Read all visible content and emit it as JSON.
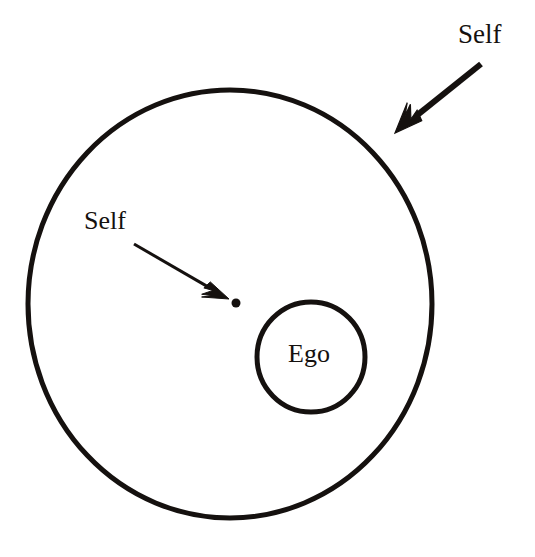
{
  "diagram": {
    "background_color": "#ffffff",
    "ink_color": "#15110f",
    "labels": {
      "self_outer": "Self",
      "self_inner": "Self",
      "ego": "Ego"
    },
    "shapes": {
      "outer_circle": {
        "name": "self-boundary-circle",
        "center_x": 230,
        "center_y": 304,
        "radius_x": 202,
        "radius_y": 214,
        "stroke_width": 5,
        "fill": "none",
        "stroke": "#15110f"
      },
      "inner_circle": {
        "name": "ego-circle",
        "center_x": 311,
        "center_y": 357,
        "radius_x": 54,
        "radius_y": 55,
        "stroke_width": 5,
        "fill": "none",
        "stroke": "#15110f"
      },
      "center_dot": {
        "name": "self-point-dot",
        "center_x": 236,
        "center_y": 303,
        "radius": 4.5,
        "fill": "#15110f"
      }
    },
    "arrows": {
      "outer_self_arrow": {
        "name": "self-boundary-arrow",
        "from_x": 481,
        "from_y": 64,
        "to_x": 395,
        "to_y": 133,
        "stroke_width": 6,
        "head_style": "barbed",
        "points_to": "outer circle edge"
      },
      "inner_self_arrow": {
        "name": "self-point-arrow",
        "from_x": 134,
        "from_y": 244,
        "to_x": 229,
        "to_y": 299,
        "stroke_width": 3,
        "head_style": "barbed",
        "points_to": "center dot"
      }
    }
  }
}
